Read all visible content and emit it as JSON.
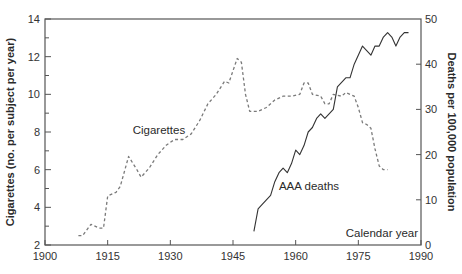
{
  "chart_data": {
    "type": "line",
    "title": "",
    "xlabel": "Calendar year",
    "ylabel_left": "Cigarettes (no. per subject per year)",
    "ylabel_right": "Deaths per 100,000 population",
    "xlim": [
      1900,
      1990
    ],
    "ylim_left": [
      2,
      14
    ],
    "ylim_right": [
      0,
      50
    ],
    "xticks": [
      1900,
      1915,
      1930,
      1945,
      1960,
      1975,
      1990
    ],
    "yticks_left": [
      2,
      4,
      6,
      8,
      10,
      12,
      14
    ],
    "yticks_right": [
      0,
      10,
      20,
      30,
      40,
      50
    ],
    "grid": false,
    "legend": "none (inline labels)",
    "annotations": [
      {
        "text": "Cigarettes",
        "x": 1921,
        "y_left": 7.9
      },
      {
        "text": "AAA deaths",
        "x": 1956,
        "y_left": 4.9
      },
      {
        "text": "Calendar year",
        "x": 1972,
        "y_left": 2.4
      }
    ],
    "series": [
      {
        "name": "Cigarettes",
        "axis": "left",
        "style": "dashed",
        "x": [
          1908,
          1909,
          1911,
          1913,
          1914,
          1915,
          1917,
          1918,
          1920,
          1922,
          1923,
          1925,
          1927,
          1929,
          1931,
          1933,
          1935,
          1937,
          1939,
          1941,
          1943,
          1944,
          1946,
          1947,
          1948,
          1949,
          1951,
          1953,
          1955,
          1957,
          1959,
          1961,
          1962,
          1963,
          1964,
          1966,
          1967,
          1968,
          1969,
          1971,
          1972,
          1973,
          1974,
          1975,
          1976,
          1977,
          1978,
          1979,
          1980,
          1981,
          1982
        ],
        "values": [
          2.5,
          2.5,
          3.1,
          2.9,
          2.9,
          4.6,
          4.8,
          5.1,
          6.7,
          6.0,
          5.6,
          6.1,
          6.8,
          7.3,
          7.6,
          7.6,
          7.9,
          8.6,
          9.5,
          10.0,
          10.7,
          10.6,
          11.9,
          11.7,
          10.0,
          9.1,
          9.1,
          9.3,
          9.7,
          9.9,
          9.9,
          10.0,
          10.6,
          10.6,
          10.0,
          9.9,
          9.5,
          9.5,
          10.0,
          9.9,
          10.1,
          10.0,
          9.9,
          9.3,
          8.5,
          8.4,
          8.2,
          7.1,
          6.2,
          6.0,
          6.0
        ]
      },
      {
        "name": "AAA deaths",
        "axis": "right",
        "style": "solid",
        "x": [
          1950,
          1951,
          1952,
          1953,
          1954,
          1955,
          1956,
          1957,
          1958,
          1959,
          1960,
          1961,
          1962,
          1963,
          1964,
          1965,
          1966,
          1967,
          1968,
          1969,
          1970,
          1971,
          1972,
          1973,
          1974,
          1975,
          1976,
          1977,
          1978,
          1979,
          1980,
          1981,
          1982,
          1983,
          1984,
          1985,
          1986,
          1987
        ],
        "values": [
          3,
          8,
          9,
          10,
          11,
          14,
          16,
          17,
          16,
          18,
          21,
          20,
          22,
          25,
          26,
          28,
          29,
          28,
          29,
          30,
          35,
          36,
          37,
          37,
          40,
          42,
          44,
          43,
          42,
          44,
          44,
          46,
          47,
          46,
          44,
          46,
          47,
          47
        ]
      }
    ]
  },
  "colors": {
    "axis": "#555555",
    "cigarettes_line": "#7a7a7a",
    "deaths_line": "#333333",
    "text": "#2a2a2a"
  }
}
